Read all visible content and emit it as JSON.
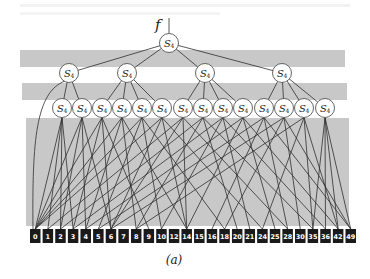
{
  "figure": {
    "caption": "(a)",
    "input_label": "f",
    "node_label_main": "S",
    "node_label_sub": "4",
    "colors": {
      "band": "#c8c8c8",
      "edge": "#2e2e2e",
      "leaf_box": "#1a1a1a",
      "node_fill": "#ffffff"
    }
  },
  "tree": {
    "root": {
      "id": "r",
      "x": 169,
      "y": 43
    },
    "level2": [
      {
        "id": "a",
        "x": 69,
        "y": 73
      },
      {
        "id": "b",
        "x": 127,
        "y": 73
      },
      {
        "id": "c",
        "x": 205,
        "y": 73
      },
      {
        "id": "d",
        "x": 282,
        "y": 73
      }
    ],
    "level3": [
      {
        "id": "n0",
        "parent": "a",
        "x": 62
      },
      {
        "id": "n1",
        "parent": "a",
        "x": 82
      },
      {
        "id": "n2",
        "parent": "b",
        "x": 102
      },
      {
        "id": "n3",
        "parent": "b",
        "x": 122
      },
      {
        "id": "n4",
        "parent": "b",
        "x": 142
      },
      {
        "id": "n5",
        "parent": "b",
        "x": 162
      },
      {
        "id": "n6",
        "parent": "c",
        "x": 183
      },
      {
        "id": "n7",
        "parent": "c",
        "x": 203
      },
      {
        "id": "n8",
        "parent": "c",
        "x": 223
      },
      {
        "id": "n9",
        "parent": "c",
        "x": 243
      },
      {
        "id": "n10",
        "parent": "d",
        "x": 264
      },
      {
        "id": "n11",
        "parent": "d",
        "x": 284
      },
      {
        "id": "n12",
        "parent": "d",
        "x": 304
      },
      {
        "id": "n13",
        "parent": "d",
        "x": 325
      }
    ],
    "level3_y": 108
  },
  "leaves": [
    "0",
    "1",
    "2",
    "3",
    "4",
    "5",
    "6",
    "7",
    "8",
    "9",
    "10",
    "12",
    "14",
    "15",
    "16",
    "18",
    "20",
    "21",
    "24",
    "25",
    "28",
    "30",
    "35",
    "36",
    "42",
    "49"
  ],
  "leaf_edges": [
    [
      "n0",
      [
        0,
        1,
        2,
        3
      ]
    ],
    [
      "n1",
      [
        0,
        2,
        4,
        6
      ]
    ],
    [
      "n2",
      [
        0,
        3,
        6,
        9
      ]
    ],
    [
      "n3",
      [
        0,
        4,
        8,
        12
      ]
    ],
    [
      "n4",
      [
        0,
        5,
        10,
        15
      ]
    ],
    [
      "n5",
      [
        0,
        6,
        12,
        18
      ]
    ],
    [
      "n6",
      [
        1,
        6,
        12,
        20
      ]
    ],
    [
      "n7",
      [
        2,
        8,
        16,
        22
      ]
    ],
    [
      "n8",
      [
        3,
        10,
        17,
        23
      ]
    ],
    [
      "n9",
      [
        4,
        12,
        19,
        24
      ]
    ],
    [
      "n10",
      [
        5,
        14,
        20,
        25
      ]
    ],
    [
      "n11",
      [
        6,
        15,
        21,
        25
      ]
    ],
    [
      "n12",
      [
        8,
        18,
        22,
        24
      ]
    ],
    [
      "n13",
      [
        22,
        23,
        24,
        25
      ]
    ]
  ]
}
